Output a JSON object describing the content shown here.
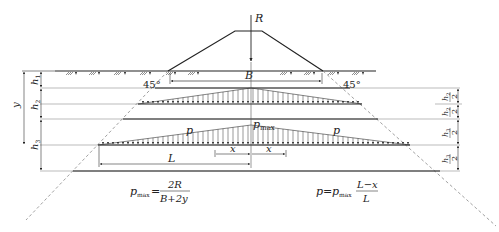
{
  "labels": {
    "R": "R",
    "B": "B",
    "angle_left": "45°",
    "angle_right": "45°",
    "h1": "h",
    "h1_sub": "1",
    "h2": "h",
    "h2_sub": "2",
    "h3": "h",
    "h3_sub": "3",
    "y": "y",
    "p_left": "p",
    "p_right": "p",
    "pmax": "p",
    "pmax_sub": "max",
    "x_left": "x",
    "x_right": "x",
    "L": "L",
    "half_den": "2"
  },
  "formulas": {
    "pmax_lhs": "p",
    "pmax_lhs_sub": "max",
    "pmax_eq": "=",
    "pmax_num": "2R",
    "pmax_den": "B+2y",
    "p_lhs": "p",
    "p_eq": "=",
    "p_rhs": "p",
    "p_rhs_sub": "max",
    "p_num": "L−x",
    "p_den": "L"
  },
  "colors": {
    "line": "#222222",
    "thin": "#555555",
    "dash": "#888888"
  }
}
